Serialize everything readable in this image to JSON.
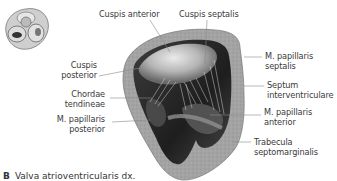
{
  "figure": {
    "caption_letter": "B",
    "caption_text": "Valva atrioventricularis dx."
  },
  "inset": {
    "description": "Small view of heart valves from above"
  },
  "labels": {
    "cuspis_anterior": "Cuspis anterior",
    "cuspis_septalis": "Cuspis septalis",
    "cuspis_posterior": [
      "Cuspis",
      "posterior"
    ],
    "chordae_tendineae": [
      "Chordae",
      "tendineae"
    ],
    "m_papillaris_posterior": [
      "M. papillaris",
      "posterior"
    ],
    "m_papillaris_septalis": [
      "M. papillaris",
      "septalis"
    ],
    "septum_interventriculare": [
      "Septum",
      "interventriculare"
    ],
    "m_papillaris_anterior": [
      "M. papillaris",
      "anterior"
    ],
    "trabecula_septomarginalis": [
      "Trabecula",
      "septomarginalis"
    ]
  },
  "colors": {
    "wall": "#9a9a9a",
    "wall_dark": "#7a7a7a",
    "cavity": "#2a2a2a",
    "leaflet": "#d8d8d8",
    "leader_line": "#8a8a8a",
    "text": "#3a3a3a"
  }
}
